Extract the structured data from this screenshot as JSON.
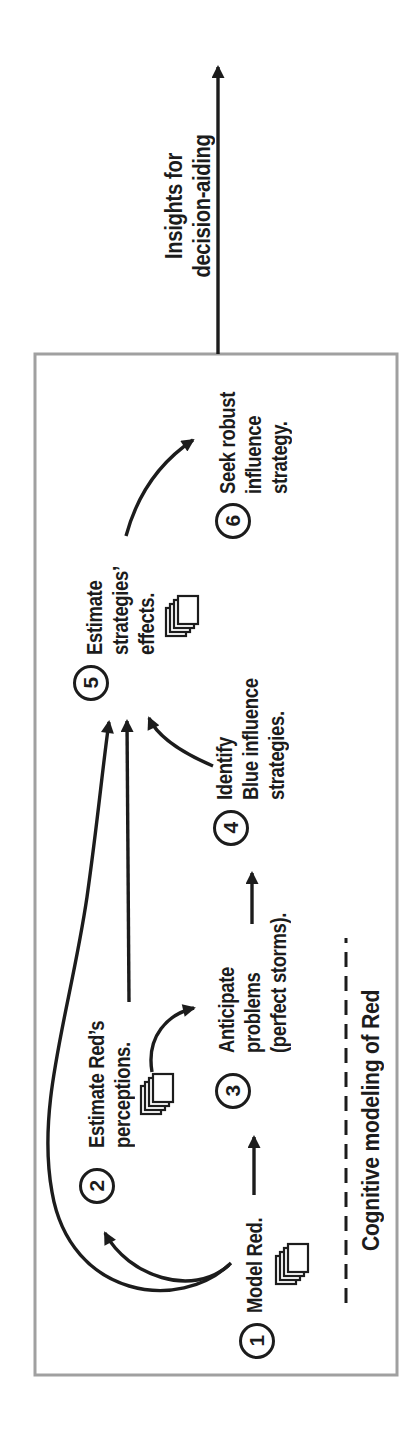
{
  "figure": {
    "outside_arrow": {
      "label_lines": [
        "Insights for",
        "decision-aiding"
      ]
    },
    "box_footer_label": "Cognitive modeling of Red",
    "steps": [
      {
        "number": "1",
        "lines": [
          "Model Red."
        ]
      },
      {
        "number": "2",
        "lines": [
          "Estimate Red’s",
          "perceptions."
        ]
      },
      {
        "number": "3",
        "lines": [
          "Anticipate",
          "problems",
          "(perfect storms)."
        ]
      },
      {
        "number": "4",
        "lines": [
          "Identify",
          "Blue influence",
          "strategies."
        ]
      },
      {
        "number": "5",
        "lines": [
          "Estimate",
          "strategies’",
          "effects."
        ]
      },
      {
        "number": "6",
        "lines": [
          "Seek robust",
          "influence",
          "strategy."
        ]
      }
    ],
    "icons": {
      "step1": "stacked-documents-icon",
      "step2": "stacked-documents-icon",
      "step5": "stacked-documents-icon"
    },
    "colors": {
      "ink": "#1c1c1c",
      "box_border": "#a0a0a0",
      "background": "#ffffff"
    }
  }
}
